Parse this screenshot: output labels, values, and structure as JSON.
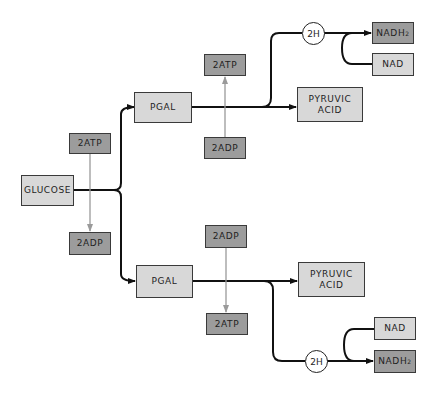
{
  "diagram": {
    "type": "glycolysis-flow",
    "colors": {
      "light_box": "#d8d8d8",
      "dark_box": "#9c9c9c",
      "main_line": "#111111",
      "energy_arrow": "#999999"
    },
    "start": {
      "glucose": "GLUCOSE",
      "atp_in": "2ATP",
      "adp_out": "2ADP"
    },
    "top_branch": {
      "pgal": "PGAL",
      "atp": "2ATP",
      "adp": "2ADP",
      "pyruvic": "PYRUVIC\nACID",
      "hydrogen": "2H",
      "nadh2": "NADH",
      "nadh2_sub": "2",
      "nad": "NAD"
    },
    "bottom_branch": {
      "pgal": "PGAL",
      "adp": "2ADP",
      "atp": "2ATP",
      "pyruvic": "PYRUVIC\nACID",
      "hydrogen": "2H",
      "nad": "NAD",
      "nadh2": "NADH",
      "nadh2_sub": "2"
    }
  }
}
